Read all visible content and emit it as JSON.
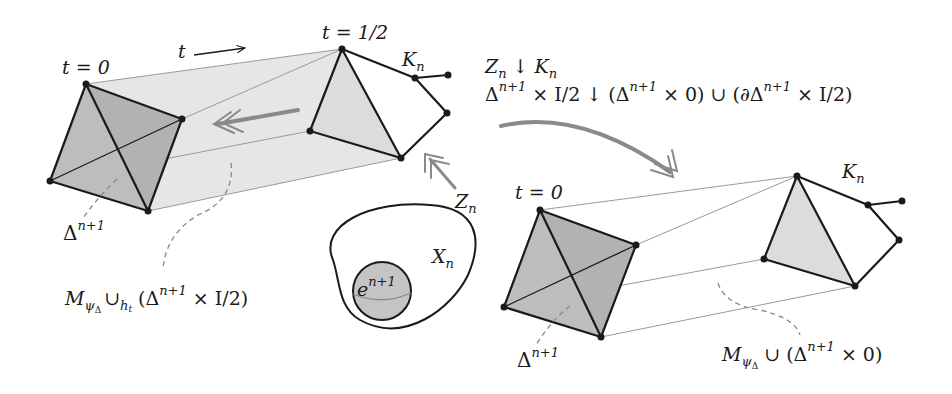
{
  "colors": {
    "ink": "#1a1a1a",
    "face_dark": "#bdbdbd",
    "face_light": "#dcdcdc",
    "prism_fill": "#e6e6e6",
    "guide_line": "#9a9a9a",
    "arrow": "#8a8a8a",
    "dashed": "#888888"
  },
  "left_figure": {
    "label_t0": "t = 0",
    "label_thalf": "t = 1/2",
    "label_t_arrow": "t",
    "label_Kn": {
      "base": "K",
      "sub": "n"
    },
    "label_Zn": {
      "base": "Z",
      "sub": "n"
    },
    "label_delta": {
      "base": "Δ",
      "sup": "n+1"
    },
    "label_mapping_cyl": {
      "M": "M",
      "sub": "ψ",
      "subsub": "Δ",
      "cup": "∪",
      "cup_sub": "h",
      "cup_subsub": "t",
      "rest_open": "(Δ",
      "rest_sup": "n+1",
      "rest_close": " × I/2)"
    }
  },
  "cell_figure": {
    "label_Xn": {
      "base": "X",
      "sub": "n"
    },
    "label_cell": {
      "base": "e",
      "sup": "n+1"
    }
  },
  "transition": {
    "line1": {
      "Z": "Z",
      "Zsub": "n",
      "arrow": " ↓ ",
      "K": "K",
      "Ksub": "n"
    },
    "line2": {
      "part1": "Δ",
      "sup1": "n+1",
      "part2": " × I/2 ↓ (Δ",
      "sup2": "n+1",
      "part3": " × 0) ∪ (∂Δ",
      "sup3": "n+1",
      "part4": " × I/2)"
    }
  },
  "right_figure": {
    "label_t0": "t = 0",
    "label_Kn": {
      "base": "K",
      "sub": "n"
    },
    "label_delta": {
      "base": "Δ",
      "sup": "n+1"
    },
    "label_mapping_cyl": {
      "M": "M",
      "sub": "ψ",
      "subsub": "Δ",
      "rest_open": " ∪ (Δ",
      "rest_sup": "n+1",
      "rest_close": " × 0)"
    }
  }
}
